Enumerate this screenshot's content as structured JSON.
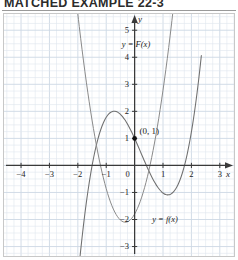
{
  "header": {
    "title": "MATCHED EXAMPLE 22-3",
    "divider": true
  },
  "figure": {
    "axis_x_name": "x",
    "axis_y_name": "y",
    "origin_label": "0",
    "point_label": "(0, 1)",
    "curve_label_upper": "y = F(x)",
    "curve_label_lower": "y = f(x)",
    "x_ticks": [
      "-4",
      "-3",
      "-2",
      "-1",
      "1",
      "2",
      "3"
    ],
    "y_ticks_pos": [
      "1",
      "2",
      "3",
      "4",
      "5"
    ],
    "y_ticks_neg": [
      "-1",
      "-2",
      "-3"
    ],
    "grid_color": "#dfe6ef",
    "grid_major_color": "#cdd8e4",
    "axis_color": "#3a3a3a",
    "curve_color": "#6f6f6f"
  },
  "chart_data": {
    "type": "line",
    "title": "MATCHED EXAMPLE 22-3",
    "xlabel": "x",
    "ylabel": "y",
    "xlim": [
      -4.6,
      3.5
    ],
    "ylim": [
      -3.35,
      5.6
    ],
    "grid": true,
    "legend": "inline-labels",
    "annotations": [
      {
        "text": "(0, 1)",
        "x": 0,
        "y": 1,
        "marker": "filled-dot"
      },
      {
        "text": "y = F(x)",
        "x": -0.35,
        "y": 4.6
      },
      {
        "text": "y = f(x)",
        "x": 0.65,
        "y": -1.95
      }
    ],
    "series": [
      {
        "name": "y = F(x)",
        "kind": "cubic",
        "color": "#6f6f6f",
        "description": "Antiderivative: local max near x=-2, local min near x=1 touching the x-axis, passes through (0,1)",
        "points": [
          [
            -3.1,
            -3.3
          ],
          [
            -3.0,
            -2.2
          ],
          [
            -2.9,
            -1.2
          ],
          [
            -2.8,
            -0.3
          ],
          [
            -2.7,
            0.5
          ],
          [
            -2.6,
            1.22
          ],
          [
            -2.5,
            1.85
          ],
          [
            -2.4,
            2.4
          ],
          [
            -2.3,
            2.88
          ],
          [
            -2.2,
            3.28
          ],
          [
            -2.1,
            3.6
          ],
          [
            -2.0,
            3.85
          ],
          [
            -1.9,
            4.03
          ],
          [
            -1.8,
            4.15
          ],
          [
            -1.7,
            4.2
          ],
          [
            -1.6,
            4.2
          ],
          [
            -1.5,
            4.15
          ],
          [
            -1.4,
            4.05
          ],
          [
            -1.3,
            3.9
          ],
          [
            -1.2,
            3.72
          ],
          [
            -1.1,
            3.5
          ],
          [
            -1.0,
            3.25
          ],
          [
            -0.9,
            2.98
          ],
          [
            -0.8,
            2.68
          ],
          [
            -0.7,
            2.37
          ],
          [
            -0.6,
            2.05
          ],
          [
            -0.5,
            1.72
          ],
          [
            -0.4,
            1.4
          ],
          [
            -0.3,
            1.1
          ],
          [
            -0.2,
            0.82
          ],
          [
            -0.1,
            0.58
          ],
          [
            0.0,
            1.0
          ],
          [
            0.1,
            0.72
          ],
          [
            0.2,
            0.5
          ],
          [
            0.3,
            0.32
          ],
          [
            0.4,
            0.18
          ],
          [
            0.5,
            0.08
          ],
          [
            0.6,
            0.02
          ],
          [
            0.7,
            0.0
          ],
          [
            0.8,
            0.0
          ],
          [
            0.9,
            0.0
          ],
          [
            1.0,
            0.0
          ],
          [
            1.1,
            0.05
          ],
          [
            1.2,
            0.15
          ],
          [
            1.3,
            0.32
          ],
          [
            1.4,
            0.56
          ],
          [
            1.5,
            0.88
          ],
          [
            1.6,
            1.28
          ],
          [
            1.7,
            1.76
          ],
          [
            1.8,
            2.32
          ],
          [
            1.9,
            2.96
          ],
          [
            2.0,
            3.68
          ],
          [
            2.1,
            4.48
          ],
          [
            2.2,
            5.36
          ],
          [
            2.28,
            5.6
          ]
        ]
      },
      {
        "name": "y = f(x)",
        "kind": "parabola",
        "color": "#8a8a8a",
        "description": "Upward parabola, vertex near (-0.33, -2.1), roots near x=-1.75 and x=1.05",
        "vertex": [
          -0.33,
          -2.1
        ],
        "roots": [
          -1.75,
          1.05
        ],
        "points": [
          [
            -2.3,
            2.0
          ],
          [
            -2.2,
            1.35
          ],
          [
            -2.1,
            0.75
          ],
          [
            -2.0,
            0.2
          ],
          [
            -1.9,
            -0.3
          ],
          [
            -1.8,
            -0.75
          ],
          [
            -1.7,
            -1.15
          ],
          [
            -1.6,
            -1.5
          ],
          [
            -1.5,
            -1.8
          ],
          [
            -1.4,
            -2.05
          ],
          [
            -1.3,
            -2.25
          ],
          [
            -1.2,
            -2.42
          ],
          [
            -1.1,
            -2.55
          ],
          [
            -1.0,
            -2.63
          ],
          [
            -0.9,
            -2.68
          ],
          [
            -0.8,
            -2.7
          ],
          [
            -0.7,
            -2.68
          ],
          [
            -0.6,
            -2.62
          ],
          [
            -0.5,
            -2.52
          ],
          [
            -0.4,
            -2.38
          ],
          [
            -0.33,
            -2.1
          ],
          [
            -0.2,
            -1.95
          ],
          [
            -0.1,
            -1.72
          ],
          [
            0.0,
            -1.45
          ],
          [
            0.1,
            -1.15
          ],
          [
            0.2,
            -0.82
          ],
          [
            0.3,
            -0.45
          ],
          [
            0.4,
            -0.05
          ],
          [
            0.5,
            0.38
          ],
          [
            0.6,
            0.85
          ],
          [
            0.7,
            1.35
          ],
          [
            0.8,
            1.88
          ],
          [
            0.9,
            2.45
          ],
          [
            1.0,
            3.05
          ],
          [
            1.1,
            3.68
          ],
          [
            1.2,
            4.35
          ],
          [
            1.3,
            5.05
          ],
          [
            1.38,
            5.6
          ]
        ]
      }
    ]
  }
}
